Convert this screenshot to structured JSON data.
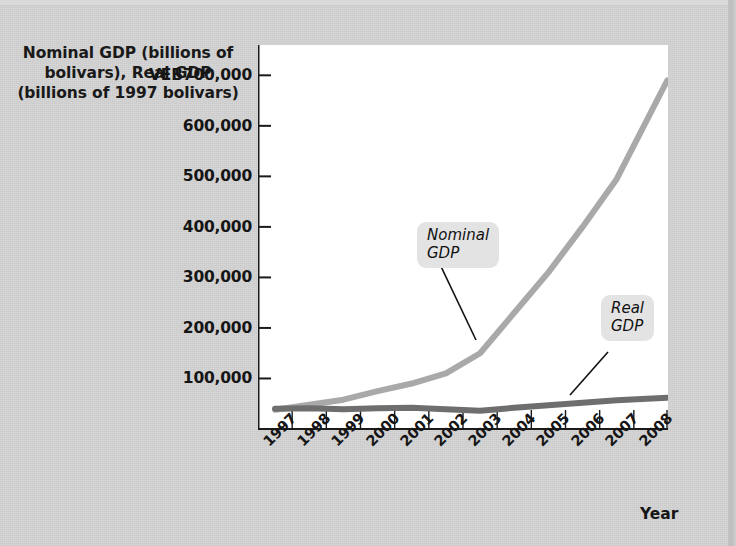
{
  "figure": {
    "background_color": "#d4d4d4",
    "plot_background_color": "#ffffff",
    "y_axis_title": "Nominal GDP\n(billions of bolivars),\nReal GDP (billions\nof 1997 bolivars)",
    "x_axis_title": "Year"
  },
  "annotations": {
    "nominal_label": "Nominal\nGDP",
    "real_label": "Real\nGDP"
  },
  "chart_data": {
    "type": "line",
    "title": "",
    "xlabel": "Year",
    "ylabel": "Nominal GDP (billions of bolivars), Real GDP (billions of 1997 bolivars)",
    "x": [
      "1997",
      "1998",
      "1999",
      "2000",
      "2001",
      "2002",
      "2003",
      "2004",
      "2005",
      "2006",
      "2007",
      "2008"
    ],
    "xtick_labels": [
      "1997",
      "1998",
      "1999",
      "2000",
      "2001",
      "2002",
      "2003",
      "2004",
      "2005",
      "2006",
      "2007",
      "2008"
    ],
    "ytick_labels": [
      "VEB700,000",
      "600,000",
      "500,000",
      "400,000",
      "300,000",
      "200,000",
      "100,000"
    ],
    "ytick_values": [
      700000,
      600000,
      500000,
      400000,
      300000,
      200000,
      100000
    ],
    "ylim": [
      0,
      760000
    ],
    "grid": false,
    "legend": "callout labels on lines",
    "series": [
      {
        "name": "Nominal GDP",
        "color": "#a9a9a9",
        "values": [
          38000,
          48000,
          58000,
          75000,
          90000,
          110000,
          150000,
          230000,
          310000,
          400000,
          495000,
          690000
        ]
      },
      {
        "name": "Real GDP",
        "color": "#6e6e6e",
        "values": [
          40000,
          41000,
          39000,
          41000,
          42000,
          39000,
          36000,
          42000,
          47000,
          52000,
          57000,
          62000
        ]
      }
    ]
  }
}
